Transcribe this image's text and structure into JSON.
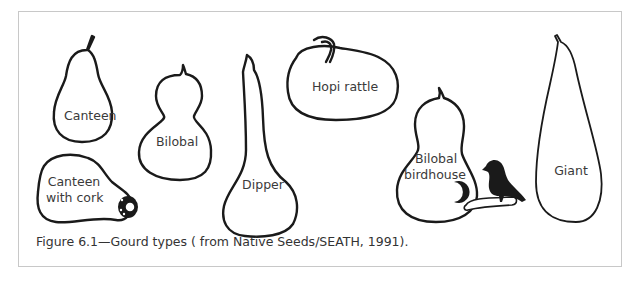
{
  "figure": {
    "caption": "Figure 6.1—Gourd types ( from Native Seeds/SEATH, 1991).",
    "gourds": [
      {
        "id": "canteen",
        "label": "Canteen"
      },
      {
        "id": "bilobal",
        "label": "Bilobal"
      },
      {
        "id": "dipper",
        "label": "Dipper"
      },
      {
        "id": "hopi-rattle",
        "label": "Hopi rattle"
      },
      {
        "id": "canteen-with-cork",
        "label_line1": "Canteen",
        "label_line2": "with cork"
      },
      {
        "id": "bilobal-birdhouse",
        "label_line1": "Bilobal",
        "label_line2": "birdhouse"
      },
      {
        "id": "giant",
        "label": "Giant"
      }
    ]
  },
  "colors": {
    "outline": "#1a1a1a",
    "frame_border": "#c8c8c8",
    "text": "#3a3a3a",
    "background": "#ffffff"
  }
}
